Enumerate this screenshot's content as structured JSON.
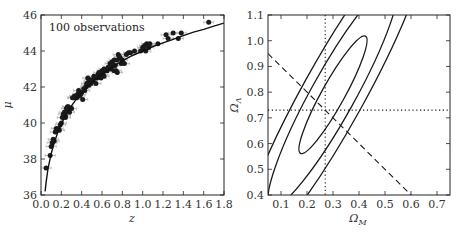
{
  "chart_data": [
    {
      "type": "scatter",
      "title": "",
      "annotation": "100 observations",
      "xlabel": "z",
      "ylabel": "μ",
      "xlim": [
        0.0,
        1.8
      ],
      "ylim": [
        36,
        46
      ],
      "xticks": [
        "0.0",
        "0.2",
        "0.4",
        "0.6",
        "0.8",
        "1.0",
        "1.2",
        "1.4",
        "1.6",
        "1.8"
      ],
      "yticks": [
        "36",
        "38",
        "40",
        "42",
        "44",
        "46"
      ],
      "grid": false,
      "series": [
        {
          "name": "observations",
          "style": "points with horizontal error bars",
          "x": [
            0.05,
            0.09,
            0.1,
            0.11,
            0.12,
            0.14,
            0.15,
            0.17,
            0.19,
            0.2,
            0.21,
            0.22,
            0.23,
            0.24,
            0.25,
            0.26,
            0.27,
            0.28,
            0.3,
            0.32,
            0.33,
            0.35,
            0.36,
            0.37,
            0.38,
            0.4,
            0.41,
            0.42,
            0.44,
            0.45,
            0.46,
            0.47,
            0.48,
            0.49,
            0.5,
            0.51,
            0.52,
            0.54,
            0.55,
            0.56,
            0.57,
            0.58,
            0.59,
            0.6,
            0.61,
            0.62,
            0.63,
            0.65,
            0.66,
            0.68,
            0.69,
            0.7,
            0.71,
            0.72,
            0.73,
            0.74,
            0.75,
            0.76,
            0.77,
            0.78,
            0.79,
            0.8,
            0.82,
            0.84,
            0.86,
            0.88,
            0.92,
            0.98,
            1.0,
            1.01,
            1.02,
            1.03,
            1.04,
            1.05,
            1.06,
            1.07,
            1.15,
            1.23,
            1.25,
            1.3,
            1.35,
            1.38,
            1.65,
            0.43,
            0.47,
            0.53,
            0.58,
            0.64,
            0.67,
            0.7,
            0.72,
            0.75,
            0.31,
            0.27,
            0.24,
            0.18,
            0.13,
            0.39,
            0.45,
            0.62
          ],
          "y": [
            37.5,
            38.2,
            38.7,
            38.9,
            39.1,
            39.5,
            39.7,
            39.7,
            39.9,
            40.0,
            40.3,
            40.5,
            40.6,
            40.4,
            40.8,
            40.9,
            40.9,
            40.6,
            40.8,
            41.4,
            41.5,
            41.4,
            41.6,
            41.8,
            41.5,
            41.7,
            41.3,
            41.9,
            42.0,
            42.1,
            42.5,
            42.3,
            42.4,
            42.2,
            42.3,
            42.4,
            42.6,
            42.2,
            42.5,
            42.7,
            42.8,
            42.6,
            42.5,
            42.9,
            42.7,
            43.0,
            42.9,
            42.9,
            43.1,
            43.3,
            43.0,
            43.4,
            43.2,
            43.5,
            43.2,
            42.9,
            43.5,
            43.8,
            43.7,
            43.6,
            43.3,
            43.5,
            43.3,
            43.8,
            43.9,
            43.9,
            44.0,
            44.0,
            44.2,
            44.1,
            44.3,
            44.0,
            44.4,
            44.3,
            44.2,
            44.4,
            44.4,
            44.9,
            44.7,
            45.0,
            44.7,
            45.0,
            45.6,
            41.8,
            42.1,
            42.5,
            42.6,
            42.9,
            43.1,
            43.3,
            42.9,
            42.8,
            41.4,
            40.7,
            40.3,
            39.6,
            39.0,
            41.6,
            42.2,
            42.6
          ],
          "xerr": 0.05
        },
        {
          "name": "model fit",
          "style": "solid line",
          "x": [
            0.04,
            0.05,
            0.07,
            0.1,
            0.13,
            0.16,
            0.2,
            0.25,
            0.3,
            0.35,
            0.4,
            0.5,
            0.6,
            0.7,
            0.8,
            0.9,
            1.0,
            1.1,
            1.2,
            1.3,
            1.4,
            1.5,
            1.6,
            1.7,
            1.8
          ],
          "y": [
            36.2,
            36.7,
            37.5,
            38.3,
            38.9,
            39.4,
            39.95,
            40.5,
            40.95,
            41.35,
            41.7,
            42.25,
            42.7,
            43.1,
            43.45,
            43.75,
            44.0,
            44.25,
            44.45,
            44.65,
            44.85,
            45.05,
            45.2,
            45.38,
            45.55
          ]
        }
      ]
    },
    {
      "type": "contour",
      "title": "",
      "xlabel": "Ω_M",
      "ylabel": "Ω_Λ",
      "xlim": [
        0.05,
        0.75
      ],
      "ylim": [
        0.4,
        1.1
      ],
      "xticks": [
        "0.1",
        "0.2",
        "0.3",
        "0.4",
        "0.5",
        "0.6",
        "0.7"
      ],
      "yticks": [
        "0.4",
        "0.5",
        "0.6",
        "0.7",
        "0.8",
        "0.9",
        "1.0",
        "1.1"
      ],
      "grid": false,
      "contours": [
        {
          "name": "1-sigma",
          "center": [
            0.3,
            0.79
          ],
          "major_px": 67,
          "minor_px": 11.5,
          "angle_deg": -61
        },
        {
          "name": "2-sigma",
          "center": [
            0.3,
            0.79
          ],
          "major_px": 128,
          "minor_px": 22,
          "angle_deg": -61
        },
        {
          "name": "3-sigma",
          "center": [
            0.3,
            0.79
          ],
          "major_px": 185,
          "minor_px": 31,
          "angle_deg": -61
        }
      ],
      "reference_lines": [
        {
          "name": "flat universe Ω_M+Ω_Λ=1",
          "style": "dashed",
          "x": [
            0.05,
            0.6
          ],
          "y": [
            0.95,
            0.4
          ]
        },
        {
          "name": "Ω_M true",
          "style": "dotted",
          "orientation": "vertical",
          "value": 0.27
        },
        {
          "name": "Ω_Λ true",
          "style": "dotted",
          "orientation": "horizontal",
          "value": 0.73
        }
      ]
    }
  ],
  "labels": {
    "left_annotation": "100 observations",
    "left_xlabel": "z",
    "left_ylabel": "μ",
    "right_xlabel_main": "Ω",
    "right_xlabel_sub": "M",
    "right_ylabel_main": "Ω",
    "right_ylabel_sub": "Λ"
  }
}
